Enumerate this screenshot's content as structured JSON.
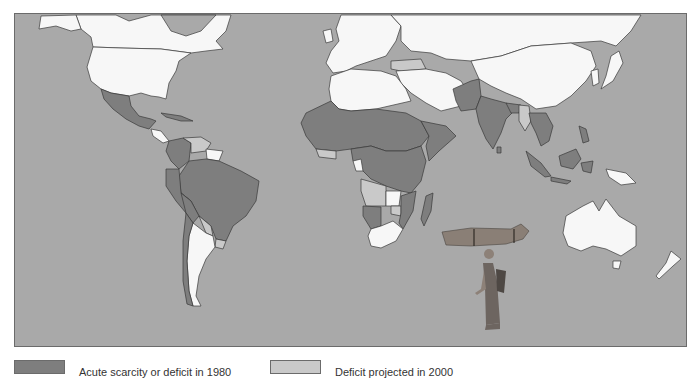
{
  "map": {
    "title": "World fuelwood situation",
    "colors": {
      "ocean": "#a9a9a9",
      "category_dark": "#7e7e7e",
      "category_light": "#c9c9c9",
      "no_data_or_other": "#f7f7f7",
      "border": "#3a3a3a"
    },
    "illustration": "woman-carrying-firewood-bundle"
  },
  "legend": {
    "items": [
      {
        "label": "Acute scarcity or deficit in 1980",
        "color": "#7e7e7e"
      },
      {
        "label": "Deficit projected in 2000",
        "color": "#c9c9c9"
      }
    ]
  }
}
